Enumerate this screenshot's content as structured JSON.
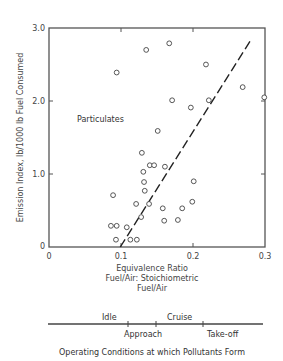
{
  "chart_data": {
    "type": "scatter",
    "title": "",
    "xlabel": "Equivalence Ratio\nFuel/Air: Stoichiometric\nFuel/Air",
    "xlabel_lines": [
      "Equivalence Ratio",
      "Fuel/Air: Stoichiometric",
      "Fuel/Air"
    ],
    "ylabel": "Emission Index, lb/1000 lb Fuel Consumed",
    "xlim": [
      0,
      0.3
    ],
    "ylim": [
      0,
      3.0
    ],
    "x_ticks": [
      "0",
      "0.1",
      "0.2",
      "0.3"
    ],
    "y_ticks": [
      "0",
      "1.0",
      "2.0",
      "3.0"
    ],
    "grid": false,
    "series": [
      {
        "name": "Particulates",
        "marker": "open-circle",
        "points": [
          [
            0.094,
            2.39
          ],
          [
            0.135,
            2.7
          ],
          [
            0.167,
            2.79
          ],
          [
            0.171,
            2.01
          ],
          [
            0.218,
            2.5
          ],
          [
            0.269,
            2.19
          ],
          [
            0.299,
            2.05
          ],
          [
            0.222,
            2.01
          ],
          [
            0.197,
            1.91
          ],
          [
            0.151,
            1.59
          ],
          [
            0.129,
            1.29
          ],
          [
            0.14,
            1.12
          ],
          [
            0.146,
            1.12
          ],
          [
            0.161,
            1.1
          ],
          [
            0.131,
            1.03
          ],
          [
            0.132,
            0.89
          ],
          [
            0.201,
            0.9
          ],
          [
            0.133,
            0.77
          ],
          [
            0.089,
            0.71
          ],
          [
            0.121,
            0.59
          ],
          [
            0.139,
            0.59
          ],
          [
            0.128,
            0.41
          ],
          [
            0.158,
            0.53
          ],
          [
            0.185,
            0.53
          ],
          [
            0.199,
            0.62
          ],
          [
            0.16,
            0.36
          ],
          [
            0.179,
            0.37
          ],
          [
            0.086,
            0.29
          ],
          [
            0.094,
            0.29
          ],
          [
            0.108,
            0.27
          ],
          [
            0.093,
            0.1
          ],
          [
            0.113,
            0.1
          ],
          [
            0.122,
            0.1
          ]
        ]
      }
    ],
    "trend_line": {
      "style": "dashed",
      "from": [
        0.099,
        0.0
      ],
      "to": [
        0.28,
        2.83
      ]
    },
    "annotations": [
      {
        "text": "Particulates",
        "x": 0.04,
        "y": 1.75
      }
    ]
  },
  "operating_conditions": {
    "caption": "Operating  Conditions  at  which  Pollutants  Form",
    "labels_above": [
      "Idle",
      "Cruise"
    ],
    "labels_below": [
      "Approach",
      "Take-off"
    ]
  }
}
